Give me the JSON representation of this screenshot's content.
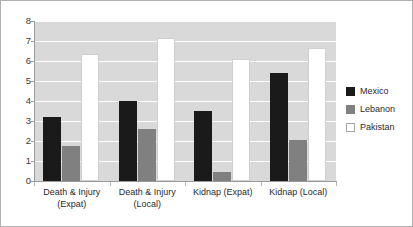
{
  "chart_data": {
    "type": "bar",
    "title": "",
    "subtitle": "",
    "xlabel": "",
    "ylabel": "",
    "categories": [
      "Death & Injury\n(Expat)",
      "Death & Injury\n(Local)",
      "Kidnap (Expat)",
      "Kidnap (Local)"
    ],
    "series": [
      {
        "name": "Mexico",
        "color": "#1a1a1a",
        "values": [
          3.2,
          4.0,
          3.5,
          5.4
        ]
      },
      {
        "name": "Lebanon",
        "color": "#808080",
        "values": [
          1.75,
          2.6,
          0.45,
          2.05
        ]
      },
      {
        "name": "Pakistan",
        "color": "#ffffff",
        "values": [
          6.35,
          7.15,
          6.1,
          6.65
        ]
      }
    ],
    "ylim": [
      0,
      8
    ],
    "yticks": [
      0,
      1,
      2,
      3,
      4,
      5,
      6,
      7,
      8
    ],
    "ytick_labels": [
      "0",
      "1",
      "2",
      "3",
      "4",
      "5",
      "6",
      "7",
      "8"
    ],
    "grid": true,
    "grid_axis": "y",
    "legend_position": "right",
    "plot_background": "#d9d9d9",
    "gridline_color": "#ffffff"
  },
  "legend": {
    "items": [
      {
        "label": "Mexico"
      },
      {
        "label": "Lebanon"
      },
      {
        "label": "Pakistan"
      }
    ]
  }
}
